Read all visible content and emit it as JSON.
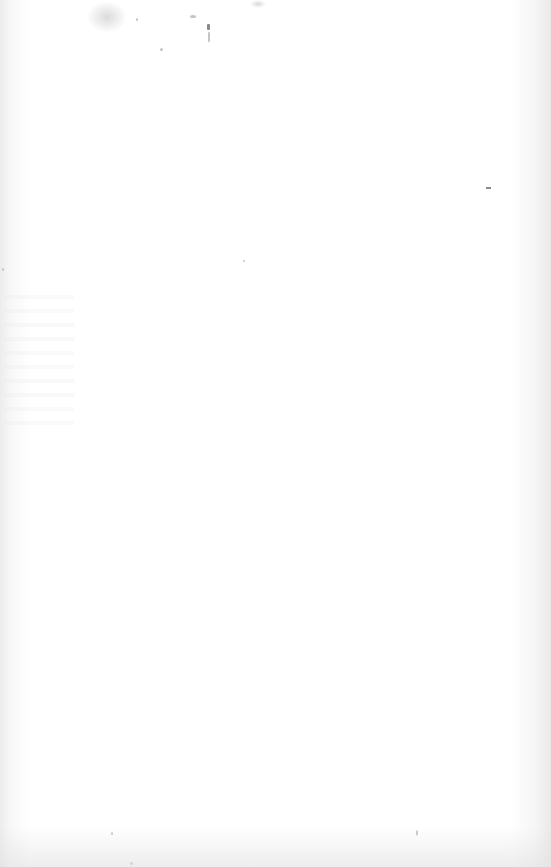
{
  "page": {
    "type": "blank scanned page",
    "background_color": "#ffffff",
    "text": ""
  },
  "marks": [
    {
      "name": "top-left-stain"
    },
    {
      "name": "top-center-speck"
    },
    {
      "name": "right-edge-dash"
    }
  ]
}
